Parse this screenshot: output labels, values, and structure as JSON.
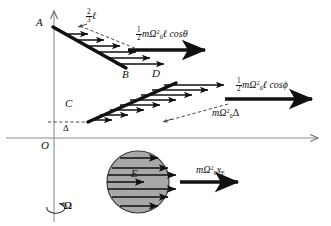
{
  "figure": {
    "type": "physics-vector-diagram",
    "background_color": "#ffffff",
    "line_color": "#111111",
    "axis_color": "#8c8c8c",
    "sphere_fill": "#a8a8a8",
    "sphere_stroke": "#3a3a3a"
  },
  "axes": {
    "origin_label": "O",
    "vertical_axis_name": "rotation-axis",
    "horizontal_axis_name": "x-axis"
  },
  "points": [
    {
      "id": "A",
      "label": "A",
      "x": 46,
      "y": 24
    },
    {
      "id": "B",
      "label": "B",
      "x": 125,
      "y": 71
    },
    {
      "id": "C",
      "label": "C",
      "x": 72,
      "y": 103
    },
    {
      "id": "D",
      "label": "D",
      "x": 153,
      "y": 78
    },
    {
      "id": "E",
      "label": "E",
      "x": 137,
      "y": 172
    }
  ],
  "labels": {
    "two_thirds_ell": {
      "numerator": "2",
      "denominator": "3",
      "symbol": "ℓ"
    },
    "delta": "Δ",
    "omega_rotation": "Ω"
  },
  "formulas": [
    {
      "id": "force-AB",
      "name": "half-m-omega0-squared-ell-cos-theta",
      "fraction": {
        "numerator": "1",
        "denominator": "2"
      },
      "body_pre": "mΩ",
      "sup": "2",
      "sub": "0",
      "body_post": "ℓ cosθ",
      "text": "½ mΩ₀² ℓ cos θ"
    },
    {
      "id": "force-CD",
      "name": "half-m-omega0-squared-ell-cos-phi",
      "fraction": {
        "numerator": "1",
        "denominator": "2"
      },
      "body_pre": "mΩ",
      "sup": "2",
      "sub": "0",
      "body_post": "ℓ cosϕ",
      "text": "½ mΩ₀² ℓ cos ϕ"
    },
    {
      "id": "force-delta",
      "name": "m-omega0-squared-delta",
      "fraction": null,
      "body_pre": "mΩ",
      "sup": "2",
      "sub": "0",
      "body_post": "Δ",
      "text": "mΩ₀² Δ"
    },
    {
      "id": "force-sphere",
      "name": "m-omega0-squared-x-E",
      "fraction": null,
      "body_pre": "mΩ",
      "sup": "2",
      "sub": "0",
      "body_post": "x",
      "body_sub": "E",
      "text": "mΩ₀² x_E"
    }
  ],
  "groups": [
    {
      "name": "rod-AB",
      "from": "A",
      "to": "B",
      "arrow_count": 6,
      "direction": "rightward",
      "resultant_bold_arrow": true
    },
    {
      "name": "rod-CD",
      "from": "C",
      "to": "D",
      "arrow_count": 8,
      "direction": "rightward",
      "resultant_bold_arrow": true
    },
    {
      "name": "sphere-E",
      "center": "E",
      "radius": 30,
      "arrow_count": 7,
      "direction": "rightward",
      "resultant_bold_arrow": true
    }
  ]
}
